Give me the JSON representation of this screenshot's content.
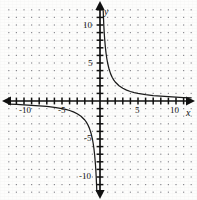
{
  "figure": {
    "kind": "coordinate-plane-graph",
    "background_color": "#fdfdfc",
    "ink_color": "#111111",
    "grid_dot_color": "#8d8d93",
    "width_px": 197,
    "height_px": 200
  },
  "axes": {
    "x_axis_label": "x",
    "y_axis_label": "y",
    "origin_px": {
      "x": 100,
      "y": 101
    },
    "pixels_per_unit": 7.6,
    "x_tick_labels": [
      "-10",
      "-5",
      "5",
      "10"
    ],
    "x_tick_values": [
      -10,
      -5,
      5,
      10
    ],
    "y_tick_labels": [
      "10",
      "5",
      "-5",
      "-10"
    ],
    "y_tick_values": [
      10,
      5,
      -5,
      -10
    ],
    "tick_interval": 1,
    "arrowheads": [
      "left",
      "right",
      "up",
      "down"
    ]
  },
  "chart_data": {
    "type": "line",
    "title": "",
    "subtitle": "",
    "xlabel": "x",
    "ylabel": "y",
    "xlim": [
      -12.5,
      12.5
    ],
    "ylim": [
      -12.5,
      12.5
    ],
    "xticks": [
      -12,
      -11,
      -10,
      -9,
      -8,
      -7,
      -6,
      -5,
      -4,
      -3,
      -2,
      -1,
      1,
      2,
      3,
      4,
      5,
      6,
      7,
      8,
      9,
      10,
      11,
      12
    ],
    "yticks": [
      -12,
      -11,
      -10,
      -9,
      -8,
      -7,
      -6,
      -5,
      -4,
      -3,
      -2,
      -1,
      1,
      2,
      3,
      4,
      5,
      6,
      7,
      8,
      9,
      10,
      11,
      12
    ],
    "xtick_labels_shown": [
      "-10",
      "-5",
      "5",
      "10"
    ],
    "ytick_labels_shown": [
      "10",
      "5",
      "-5",
      "-10"
    ],
    "grid": "dotted",
    "grid_spacing": 1,
    "legend": "none",
    "equation": "y = 5/x",
    "asymptotes": {
      "vertical": 0,
      "horizontal": 0
    },
    "series": [
      {
        "name": "y = 5/x (branch 1, quadrant I)",
        "x": [
          0.42,
          0.45,
          0.5,
          0.55,
          0.6,
          0.7,
          0.8,
          0.9,
          1.0,
          1.2,
          1.4,
          1.6,
          1.8,
          2.0,
          2.5,
          3.0,
          3.5,
          4.0,
          4.5,
          5.0,
          6.0,
          7.0,
          8.0,
          9.0,
          10.0,
          11.0,
          12.0
        ],
        "y": [
          11.9,
          11.11,
          10.0,
          9.09,
          8.33,
          7.14,
          6.25,
          5.56,
          5.0,
          4.17,
          3.57,
          3.13,
          2.78,
          2.5,
          2.0,
          1.67,
          1.43,
          1.25,
          1.11,
          1.0,
          0.83,
          0.71,
          0.63,
          0.56,
          0.5,
          0.45,
          0.42
        ]
      },
      {
        "name": "y = 5/x (branch 2, quadrant III)",
        "x": [
          -12.0,
          -11.0,
          -10.0,
          -9.0,
          -8.0,
          -7.0,
          -6.0,
          -5.0,
          -4.5,
          -4.0,
          -3.5,
          -3.0,
          -2.5,
          -2.0,
          -1.8,
          -1.6,
          -1.4,
          -1.2,
          -1.0,
          -0.9,
          -0.8,
          -0.7,
          -0.6,
          -0.55,
          -0.5,
          -0.45,
          -0.42
        ],
        "y": [
          -0.42,
          -0.45,
          -0.5,
          -0.56,
          -0.63,
          -0.71,
          -0.83,
          -1.0,
          -1.11,
          -1.25,
          -1.43,
          -1.67,
          -2.0,
          -2.5,
          -2.78,
          -3.13,
          -3.57,
          -4.17,
          -5.0,
          -5.56,
          -6.25,
          -7.14,
          -8.33,
          -9.09,
          -10.0,
          -11.11,
          -11.9
        ]
      }
    ]
  }
}
